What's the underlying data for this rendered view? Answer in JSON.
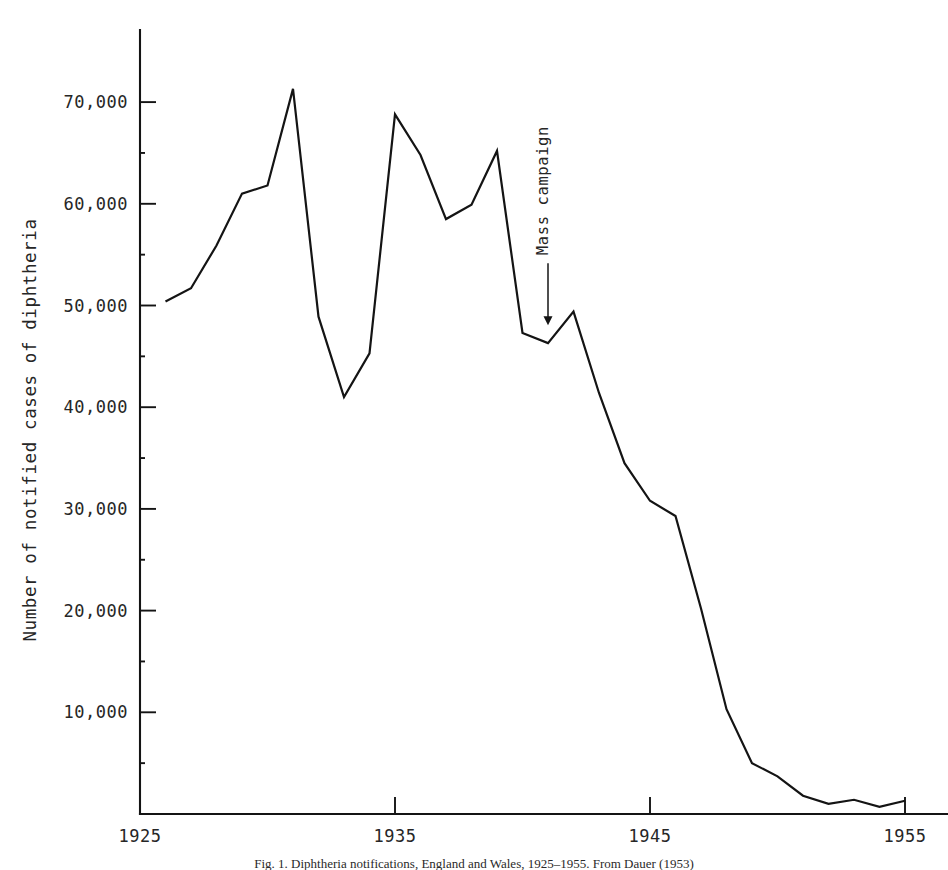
{
  "figure": {
    "caption": "Fig. 1.   Diphtheria notifications, England and Wales, 1925–1955. From Dauer (1953)"
  },
  "chart_data": {
    "type": "line",
    "title": "",
    "xlabel": "",
    "ylabel": "Number of notified cases of diphtheria",
    "xlim": [
      1925,
      1955
    ],
    "ylim": [
      0,
      75000
    ],
    "grid": false,
    "legend": null,
    "xticks": [
      1925,
      1935,
      1945,
      1955
    ],
    "xtick_labels": [
      "1925",
      "1935",
      "1945",
      "1955"
    ],
    "yticks": [
      10000,
      20000,
      30000,
      40000,
      50000,
      60000,
      70000
    ],
    "ytick_labels": [
      "10,000",
      "20,000",
      "30,000",
      "40,000",
      "50,000",
      "60,000",
      "70,000"
    ],
    "minor_yticks": [
      5000,
      15000,
      25000,
      35000,
      45000,
      55000,
      65000
    ],
    "series": [
      {
        "name": "Notified cases of diphtheria",
        "color": "#141414",
        "x": [
          1926,
          1927,
          1928,
          1929,
          1930,
          1931,
          1932,
          1933,
          1934,
          1935,
          1936,
          1937,
          1938,
          1939,
          1940,
          1941,
          1942,
          1943,
          1944,
          1945,
          1946,
          1947,
          1948,
          1949,
          1950,
          1951,
          1952,
          1953,
          1954,
          1955
        ],
        "values": [
          50400,
          51700,
          55900,
          61000,
          61800,
          71300,
          48900,
          41000,
          45300,
          68800,
          64800,
          58500,
          59900,
          65200,
          47300,
          46300,
          49400,
          41400,
          34500,
          30800,
          29300,
          20200,
          10300,
          5000,
          3700,
          1800,
          1000,
          1400,
          700,
          1300
        ]
      }
    ],
    "annotations": [
      {
        "text": "Mass campaign",
        "x": 1941,
        "y": 46300,
        "arrow": "down"
      }
    ]
  }
}
